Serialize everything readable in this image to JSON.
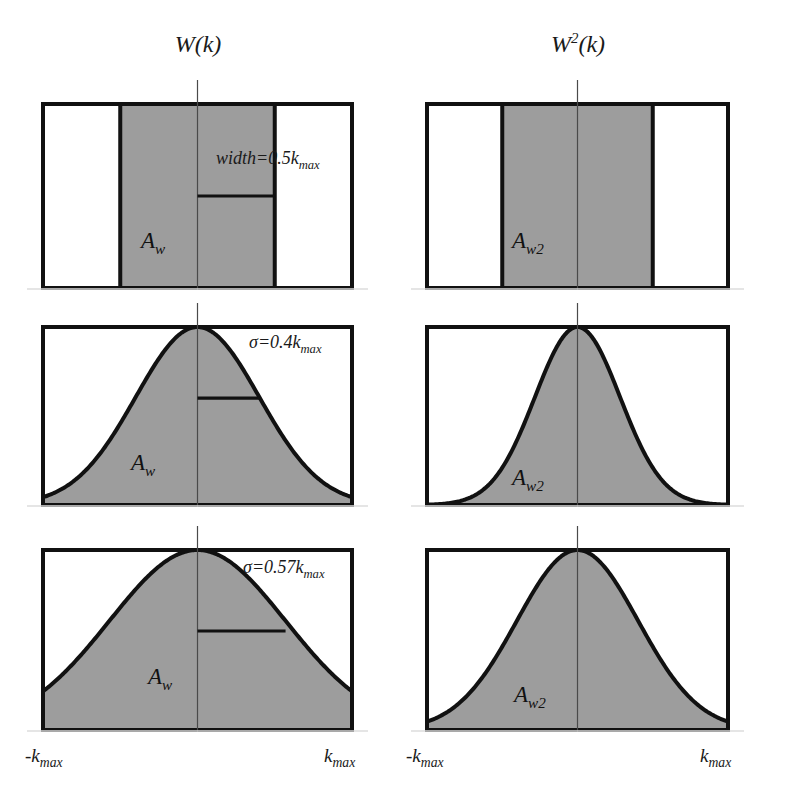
{
  "figure": {
    "background_color": "#ffffff",
    "fill_color": "#9d9d9d",
    "line_color": "#111111",
    "axis_color": "#4a4a4a"
  },
  "columns": [
    {
      "title_main": "W",
      "title_sup": "",
      "title_rest": "(k)",
      "label": "W(k)"
    },
    {
      "title_main": "W",
      "title_sup": "2",
      "title_rest": "(k)",
      "label": "W2(k)"
    }
  ],
  "axis": {
    "left_tick_prefix": "-k",
    "left_tick_sub": "max",
    "right_tick_prefix": "k",
    "right_tick_sub": "max",
    "left_tick_label": "-kmax",
    "right_tick_label": "kmax"
  },
  "rows": [
    {
      "name": "rectangular-window",
      "window_type": "rect",
      "param_prefix": "width=0.5k",
      "param_sub": "max",
      "param_label": "width=0.5kmax",
      "left_area_label_main": "A",
      "left_area_label_sub": "w",
      "right_area_label_main": "A",
      "right_area_label_sub": "w2",
      "left_area_label": "Aw",
      "right_area_label": "Aw2",
      "rect_half_width_frac": 0.5,
      "rect_half_width_frac_squared": 0.5,
      "marker_level": 0.5
    },
    {
      "name": "gaussian-window-sigma-0.4",
      "window_type": "gaussian",
      "param_prefix": "σ=0.4k",
      "param_sub": "max",
      "param_label": "σ=0.4kmax",
      "left_area_label_main": "A",
      "left_area_label_sub": "w",
      "right_area_label_main": "A",
      "right_area_label_sub": "w2",
      "left_area_label": "Aw",
      "right_area_label": "Aw2",
      "sigma": 0.4,
      "marker_level": 0.6
    },
    {
      "name": "gaussian-window-sigma-0.57",
      "window_type": "gaussian",
      "param_prefix": "σ=0.57k",
      "param_sub": "max",
      "param_label": "σ=0.57kmax",
      "left_area_label_main": "A",
      "left_area_label_sub": "w",
      "right_area_label_main": "A",
      "right_area_label_sub": "w2",
      "left_area_label": "Aw",
      "right_area_label": "Aw2",
      "sigma": 0.57,
      "marker_level": 0.55
    }
  ],
  "chart_data": {
    "type": "area",
    "xlabel": "k",
    "ylabel": "",
    "xlim": [
      -1,
      1
    ],
    "ylim": [
      0,
      1
    ],
    "xtick_labels": [
      "-kmax",
      "kmax"
    ],
    "grid": false,
    "legend": "none",
    "panels": [
      {
        "row": 1,
        "column": 1,
        "title": "W(k)",
        "function": "rect",
        "half_width": 0.5,
        "annotation": "width=0.5kmax",
        "area_label": "Aw",
        "x": [
          -1.0,
          -0.5,
          -0.5,
          0.5,
          0.5,
          1.0
        ],
        "y": [
          0.0,
          0.0,
          1.0,
          1.0,
          0.0,
          0.0
        ]
      },
      {
        "row": 1,
        "column": 2,
        "title": "W2(k)",
        "function": "rect_squared",
        "half_width": 0.5,
        "annotation": "",
        "area_label": "Aw2",
        "x": [
          -1.0,
          -0.5,
          -0.5,
          0.5,
          0.5,
          1.0
        ],
        "y": [
          0.0,
          0.0,
          1.0,
          1.0,
          0.0,
          0.0
        ]
      },
      {
        "row": 2,
        "column": 1,
        "title": "W(k)",
        "function": "gaussian",
        "sigma": 0.4,
        "annotation": "σ=0.4kmax",
        "area_label": "Aw",
        "x": [
          -1.0,
          -0.8,
          -0.6,
          -0.4,
          -0.2,
          0.0,
          0.2,
          0.4,
          0.6,
          0.8,
          1.0
        ],
        "y": [
          0.044,
          0.135,
          0.325,
          0.607,
          0.882,
          1.0,
          0.882,
          0.607,
          0.325,
          0.135,
          0.044
        ]
      },
      {
        "row": 2,
        "column": 2,
        "title": "W2(k)",
        "function": "gaussian_squared",
        "sigma": 0.4,
        "annotation": "",
        "area_label": "Aw2",
        "x": [
          -1.0,
          -0.8,
          -0.6,
          -0.4,
          -0.2,
          0.0,
          0.2,
          0.4,
          0.6,
          0.8,
          1.0
        ],
        "y": [
          0.002,
          0.018,
          0.105,
          0.368,
          0.779,
          1.0,
          0.779,
          0.368,
          0.105,
          0.018,
          0.002
        ]
      },
      {
        "row": 3,
        "column": 1,
        "title": "W(k)",
        "function": "gaussian",
        "sigma": 0.57,
        "annotation": "σ=0.57kmax",
        "area_label": "Aw",
        "x": [
          -1.0,
          -0.8,
          -0.6,
          -0.4,
          -0.2,
          0.0,
          0.2,
          0.4,
          0.6,
          0.8,
          1.0
        ],
        "y": [
          0.216,
          0.372,
          0.575,
          0.78,
          0.94,
          1.0,
          0.94,
          0.78,
          0.575,
          0.372,
          0.216
        ]
      },
      {
        "row": 3,
        "column": 2,
        "title": "W2(k)",
        "function": "gaussian_squared",
        "sigma": 0.57,
        "annotation": "",
        "area_label": "Aw2",
        "x": [
          -1.0,
          -0.8,
          -0.6,
          -0.4,
          -0.2,
          0.0,
          0.2,
          0.4,
          0.6,
          0.8,
          1.0
        ],
        "y": [
          0.047,
          0.138,
          0.331,
          0.608,
          0.883,
          1.0,
          0.883,
          0.608,
          0.331,
          0.138,
          0.047
        ]
      }
    ]
  }
}
